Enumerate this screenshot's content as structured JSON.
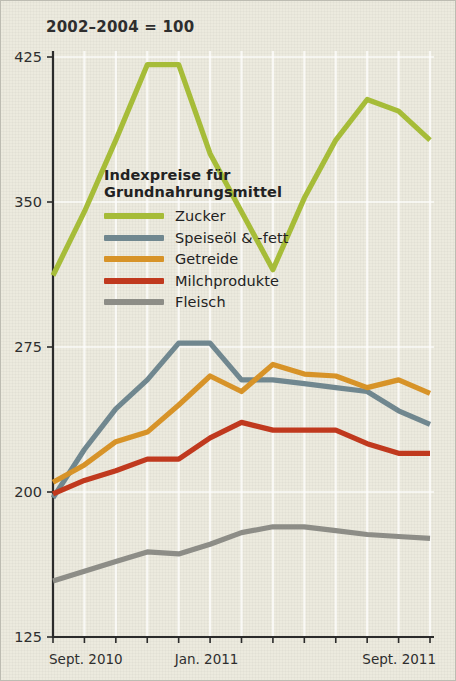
{
  "figure": {
    "index_note": "2002–2004 = 100",
    "legend_title_line1": "Indexpreise für",
    "legend_title_line2": "Grundnahrungsmittel"
  },
  "axes": {
    "y_ticks": [
      "425",
      "350",
      "275",
      "200",
      "125"
    ],
    "x_labels": [
      "Sept. 2010",
      "Jan. 2011",
      "Sept. 2011"
    ]
  },
  "colors": {
    "zucker": "#a6bc38",
    "speiseoel": "#70878f",
    "getreide": "#d79328",
    "milchprodukte": "#c0391e",
    "fleisch": "#8d8d87",
    "background": "#eceade",
    "axis": "#2b2b2b",
    "grid": "#ffffff"
  },
  "chart_data": {
    "type": "line",
    "title": "Indexpreise für Grundnahrungsmittel",
    "subtitle": "2002–2004 = 100",
    "xlabel": "",
    "ylabel": "",
    "ylim": [
      125,
      425
    ],
    "yticks": [
      425,
      350,
      275,
      200,
      125
    ],
    "grid": true,
    "legend_position": "inside-upper-left",
    "x": [
      "Sept. 2010",
      "Okt. 2010",
      "Nov. 2010",
      "Dez. 2010",
      "Jan. 2011",
      "Feb. 2011",
      "März 2011",
      "Apr. 2011",
      "Mai 2011",
      "Juni 2011",
      "Juli 2011",
      "Aug. 2011",
      "Sept. 2011"
    ],
    "xtick_labels": {
      "0": "Sept. 2010",
      "4": "Jan. 2011",
      "12": "Sept. 2011"
    },
    "series": [
      {
        "name": "Zucker",
        "color": "#a6bc38",
        "values": [
          312,
          345,
          382,
          421,
          421,
          375,
          345,
          315,
          352,
          382,
          403,
          397,
          382
        ]
      },
      {
        "name": "Speiseöl & -fett",
        "color": "#70878f",
        "values": [
          197,
          222,
          243,
          258,
          277,
          277,
          258,
          258,
          256,
          254,
          252,
          242,
          235
        ]
      },
      {
        "name": "Getreide",
        "color": "#d79328",
        "values": [
          205,
          214,
          226,
          231,
          245,
          260,
          252,
          266,
          261,
          260,
          254,
          258,
          251
        ]
      },
      {
        "name": "Milchprodukte",
        "color": "#c0391e",
        "values": [
          199,
          206,
          211,
          217,
          217,
          228,
          236,
          232,
          232,
          232,
          225,
          220,
          220
        ]
      },
      {
        "name": "Fleisch",
        "color": "#8d8d87",
        "values": [
          154,
          159,
          164,
          169,
          168,
          173,
          179,
          182,
          182,
          180,
          178,
          177,
          176
        ]
      }
    ]
  }
}
